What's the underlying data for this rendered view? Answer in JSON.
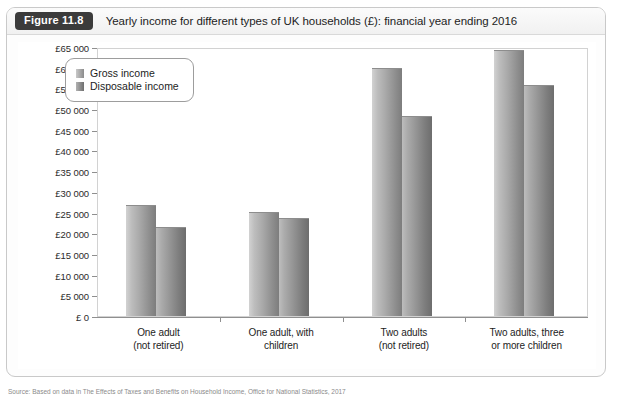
{
  "figure": {
    "badge": "Figure 11.8",
    "caption": "Yearly income for different types of UK households (£): financial year ending 2016"
  },
  "chart_data": {
    "type": "bar",
    "title": "Yearly income for different types of UK households (£): financial year ending 2016",
    "xlabel": "",
    "ylabel": "",
    "ylim": [
      0,
      65000
    ],
    "ytick_step": 5000,
    "grid": true,
    "legend_position": "top-left-inside",
    "currency_symbol": "£",
    "categories": [
      "One adult\n(not retired)",
      "One adult, with\nchildren",
      "Two adults\n(not retired)",
      "Two adults, three\nor more children"
    ],
    "ytick_labels": [
      "£65 000",
      "£60 000",
      "£55 000",
      "£50 000",
      "£45 000",
      "£40 000",
      "£35 000",
      "£30 000",
      "£25 000",
      "£20 000",
      "£15 000",
      "£10 000",
      "£5 000",
      "£ 0"
    ],
    "ytick_values": [
      65000,
      60000,
      55000,
      50000,
      45000,
      40000,
      35000,
      30000,
      25000,
      20000,
      15000,
      10000,
      5000,
      0
    ],
    "series": [
      {
        "name": "Gross income",
        "color": "#a9a9a9",
        "values": [
          26500,
          25000,
          59800,
          64000
        ]
      },
      {
        "name": "Disposable income",
        "color": "#8b8b8b",
        "values": [
          21200,
          23500,
          48000,
          55500
        ]
      }
    ]
  },
  "source": {
    "note": "Source: Based on data in The Effects of Taxes and Benefits on Household Income, Office for National Statistics, 2017"
  }
}
